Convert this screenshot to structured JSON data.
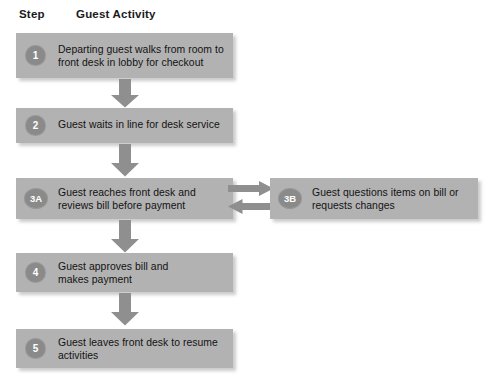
{
  "diagram": {
    "background_color": "#ffffff",
    "box_color": "#b2b2b2",
    "badge_color": "#8a8a8a",
    "arrow_color": "#8f8f8f",
    "text_color": "#121212",
    "headers": {
      "step": "Step",
      "activity": "Guest Activity"
    },
    "steps": [
      {
        "id": "1",
        "badge": "1",
        "badge_shape": "circle",
        "lines": [
          "Departing guest walks from room to",
          "front desk in lobby for checkout"
        ]
      },
      {
        "id": "2",
        "badge": "2",
        "badge_shape": "circle",
        "lines": [
          "Guest waits in line for desk service"
        ]
      },
      {
        "id": "3A",
        "badge": "3A",
        "badge_shape": "oval",
        "lines": [
          "Guest reaches front desk and",
          "reviews bill before payment"
        ]
      },
      {
        "id": "3B",
        "badge": "3B",
        "badge_shape": "oval",
        "lines": [
          "Guest questions items on bill or",
          "requests changes"
        ]
      },
      {
        "id": "4",
        "badge": "4",
        "badge_shape": "circle",
        "lines": [
          "Guest approves bill and",
          "makes payment"
        ]
      },
      {
        "id": "5",
        "badge": "5",
        "badge_shape": "circle",
        "lines": [
          "Guest leaves front desk to resume",
          "activities"
        ]
      }
    ],
    "connectors": [
      {
        "name": "arrow-1-to-2",
        "direction": "down"
      },
      {
        "name": "arrow-2-to-3a",
        "direction": "down"
      },
      {
        "name": "arrow-3a-to-3b",
        "direction": "right"
      },
      {
        "name": "arrow-3b-to-3a",
        "direction": "left"
      },
      {
        "name": "arrow-3a-to-4",
        "direction": "down"
      },
      {
        "name": "arrow-4-to-5",
        "direction": "down"
      }
    ]
  }
}
